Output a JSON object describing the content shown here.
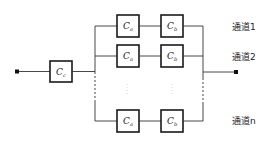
{
  "diagram": {
    "type": "reliability-block-diagram",
    "input_block": {
      "label": "C",
      "subscript": "c"
    },
    "channels": [
      {
        "label": "通道1",
        "blocks": [
          {
            "label": "C",
            "subscript": "a"
          },
          {
            "label": "C",
            "subscript": "b"
          }
        ]
      },
      {
        "label": "通道2",
        "blocks": [
          {
            "label": "C",
            "subscript": "a"
          },
          {
            "label": "C",
            "subscript": "b"
          }
        ]
      },
      {
        "label": "通道n",
        "blocks": [
          {
            "label": "C",
            "subscript": "a"
          },
          {
            "label": "C",
            "subscript": "b"
          }
        ]
      }
    ],
    "colors": {
      "line": "#333333",
      "box_border": "#1a1a1a",
      "background": "#ffffff"
    }
  }
}
